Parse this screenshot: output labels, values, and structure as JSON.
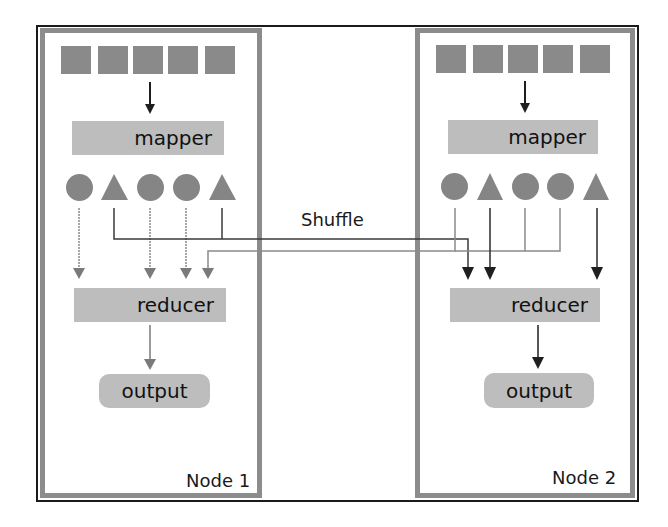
{
  "diagram": {
    "shuffle_label": "Shuffle",
    "colors": {
      "frame": "#1a1a1a",
      "node_border": "#8c8c8c",
      "shape_fill": "#8a8a8a",
      "box_fill": "#bdbdbd",
      "arrow_dark": "#222222",
      "arrow_gray": "#7a7a7a"
    },
    "nodes": [
      {
        "label": "Node 1",
        "input_blocks": 5,
        "mapper_label": "mapper",
        "intermediate": [
          "circle",
          "triangle",
          "circle",
          "circle",
          "triangle"
        ],
        "reducer_label": "reducer",
        "output_label": "output"
      },
      {
        "label": "Node 2",
        "input_blocks": 5,
        "mapper_label": "mapper",
        "intermediate": [
          "circle",
          "triangle",
          "circle",
          "circle",
          "triangle"
        ],
        "reducer_label": "reducer",
        "output_label": "output"
      }
    ],
    "flows": [
      {
        "from": "Node 1 circles",
        "to": "Node 1 reducer",
        "style": "gray dotted"
      },
      {
        "from": "Node 1 triangles",
        "to": "Node 2 reducer",
        "style": "dark solid"
      },
      {
        "from": "Node 2 circles",
        "to": "Node 1 reducer",
        "style": "gray dotted"
      },
      {
        "from": "Node 2 triangles",
        "to": "Node 2 reducer",
        "style": "dark solid"
      }
    ]
  }
}
